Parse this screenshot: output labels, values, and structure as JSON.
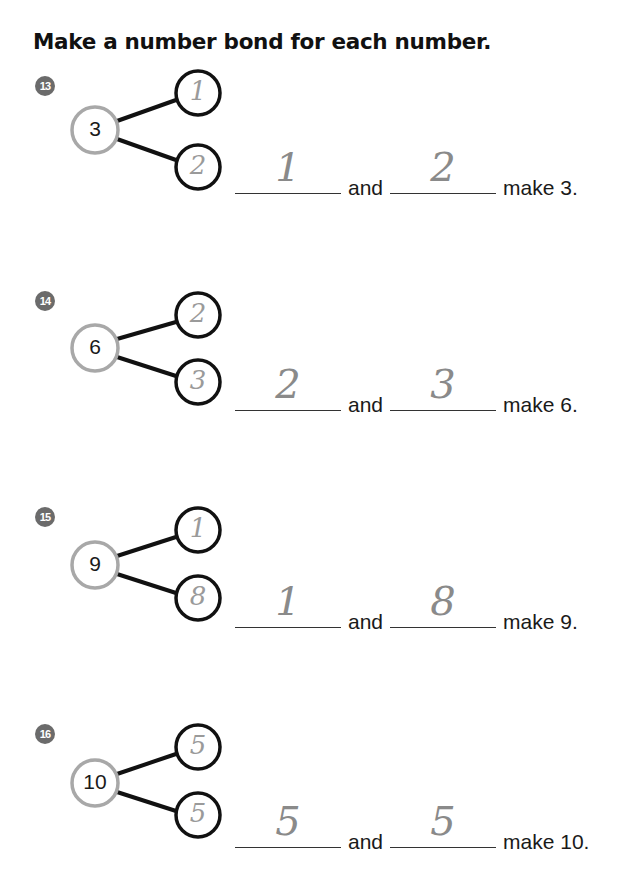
{
  "page": {
    "title": "Make a number bond for each number."
  },
  "colors": {
    "badge_bg": "#6b6b6b",
    "whole_circle_stroke": "#a8a8a8",
    "part_circle_stroke": "#111111",
    "connector_line": "#111111",
    "handwriting": "#8a8a8a"
  },
  "problems": [
    {
      "number": "13",
      "whole": "3",
      "parts_written": [
        "1",
        "2"
      ],
      "blanks_written": [
        "1",
        "2"
      ],
      "connector_word": "and",
      "tail": "make 3."
    },
    {
      "number": "14",
      "whole": "6",
      "parts_written": [
        "2",
        "3"
      ],
      "blanks_written": [
        "2",
        "3"
      ],
      "connector_word": "and",
      "tail": "make 6."
    },
    {
      "number": "15",
      "whole": "9",
      "parts_written": [
        "1",
        "8"
      ],
      "blanks_written": [
        "1",
        "8"
      ],
      "connector_word": "and",
      "tail": "make 9."
    },
    {
      "number": "16",
      "whole": "10",
      "parts_written": [
        "5",
        "5"
      ],
      "blanks_written": [
        "5",
        "5"
      ],
      "connector_word": "and",
      "tail": "make 10."
    }
  ]
}
